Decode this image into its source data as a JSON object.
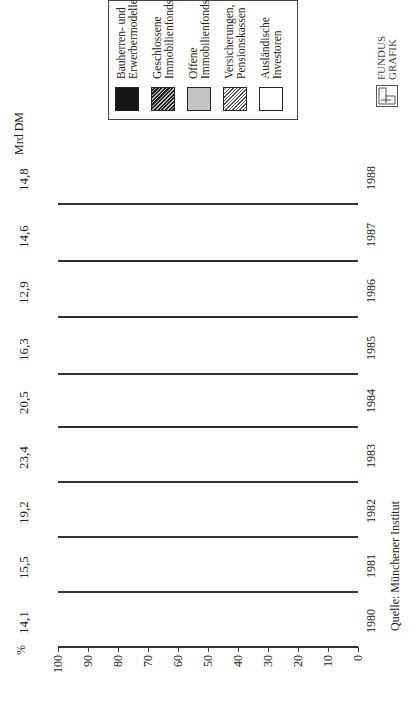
{
  "chart_data": {
    "type": "bar",
    "stacked": true,
    "orientation": "vertical (image rotated 90° counter-clockwise)",
    "title": "",
    "xlabel": "",
    "ylabel": "%",
    "ylim": [
      0,
      100
    ],
    "yticks": [
      0,
      10,
      20,
      30,
      40,
      50,
      60,
      70,
      80,
      90,
      100
    ],
    "categories": [
      "1980",
      "1981",
      "1982",
      "1983",
      "1984",
      "1985",
      "1986",
      "1987",
      "1988"
    ],
    "totals_label_unit": "Mrd DM",
    "totals": [
      "14,1",
      "15,5",
      "19,2",
      "23,4",
      "20,5",
      "16,3",
      "12,9",
      "14,6",
      "14,8"
    ],
    "series": [
      {
        "name": "Bauherren- und Erwerbermodelle",
        "pattern": "black",
        "values": [
          60,
          61,
          62,
          60,
          50,
          39,
          24,
          14,
          16
        ]
      },
      {
        "name": "Geschlossene Immobilienfonds",
        "pattern": "dark-hatch",
        "values": [
          15,
          14,
          10,
          13,
          21,
          25,
          25,
          26,
          27
        ]
      },
      {
        "name": "Offene Immobilienfonds",
        "pattern": "dotted-grey",
        "values": [
          2,
          0,
          3,
          6,
          4,
          5,
          11,
          22,
          17
        ]
      },
      {
        "name": "Versicherungen, Pensionskassen",
        "pattern": "light-hatch",
        "values": [
          16,
          19,
          17,
          16,
          17,
          19,
          21,
          20,
          20
        ]
      },
      {
        "name": "Ausländische Investoren",
        "pattern": "white",
        "values": [
          7,
          6,
          8,
          5,
          8,
          12,
          19,
          18,
          20
        ]
      }
    ],
    "legend_position": "top-right (upper right in rotated view)",
    "source": "Quelle: Münchener Institut",
    "grid": false
  },
  "labels": {
    "percent_axis": "%",
    "unit": "Mrd DM",
    "source": "Quelle: Münchener Institut"
  },
  "legend": [
    {
      "label": "Ausländische\nInvestoren",
      "pattern": "white"
    },
    {
      "label": "Versicherungen,\nPensionskassen",
      "pattern": "diag-light"
    },
    {
      "label": "Offene\nImmobilienfonds",
      "pattern": "dotted"
    },
    {
      "label": "Geschlossene\nImmobilienfonds",
      "pattern": "diag-dark"
    },
    {
      "label": "Bauherren- und\nErwerbermodelle",
      "pattern": "black"
    }
  ],
  "logo": {
    "text": "FUNDUS\nGRAFIK"
  }
}
